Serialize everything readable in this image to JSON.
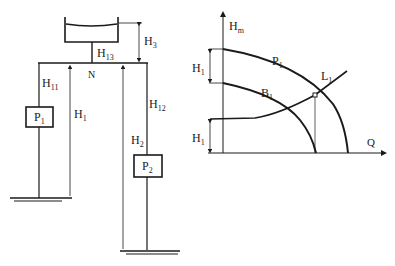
{
  "schematic": {
    "tank_label": "",
    "junction_label": "N",
    "pump_left": {
      "main": "P",
      "sub": "1"
    },
    "pump_right": {
      "main": "P",
      "sub": "2"
    },
    "labels": {
      "h3": {
        "main": "H",
        "sub": "3"
      },
      "h13": {
        "main": "H",
        "sub": "13"
      },
      "h11": {
        "main": "H",
        "sub": "11"
      },
      "h12": {
        "main": "H",
        "sub": "12"
      },
      "h1": {
        "main": "H",
        "sub": "1"
      },
      "h2": {
        "main": "H",
        "sub": "2"
      }
    }
  },
  "graph": {
    "y_axis": {
      "main": "H",
      "sub": "m"
    },
    "x_axis": "Q",
    "curve_p1": {
      "main": "P",
      "sub": "1"
    },
    "curve_b1": {
      "main": "B",
      "sub": "1"
    },
    "curve_l1": {
      "main": "L",
      "sub": "1"
    },
    "dim_upper": {
      "main": "H",
      "sub": "1"
    },
    "dim_lower": {
      "main": "H",
      "sub": "1"
    }
  },
  "colors": {
    "line": "#1a1a1a",
    "background": "#ffffff"
  }
}
